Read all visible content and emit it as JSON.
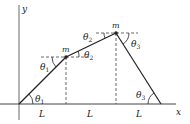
{
  "diagram": {
    "axes": {
      "x_label": "x",
      "y_label": "y"
    },
    "masses": [
      {
        "label": "m"
      },
      {
        "label": "m"
      }
    ],
    "angles": {
      "theta1_symbol": "θ",
      "theta1_sub": "1",
      "theta2_symbol": "θ",
      "theta2_sub": "2",
      "theta3_symbol": "θ",
      "theta3_sub": "3"
    },
    "spans": [
      "L",
      "L",
      "L"
    ],
    "colors": {
      "line": "#222222",
      "axis": "#555555",
      "dash": "#444444"
    }
  }
}
